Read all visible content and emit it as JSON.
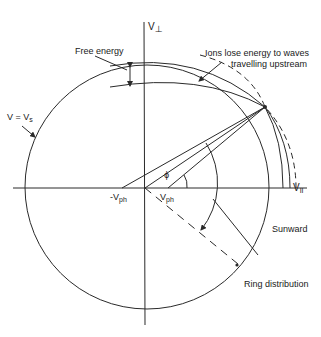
{
  "diagram": {
    "colors": {
      "line": "#2a2a2a",
      "background": "#ffffff"
    },
    "axes": {
      "v_perp": {
        "label": "V",
        "subscript": "⊥"
      },
      "v_par": {
        "label": "V",
        "subscript": "II"
      }
    },
    "labels": {
      "free_energy": "Free energy",
      "v_equals_vs": {
        "text": "V = V",
        "subscript": "s"
      },
      "ions_lose_line1": "Ions lose energy to waves",
      "ions_lose_line2": "travelling upstream",
      "neg_vph": {
        "text": "-V",
        "subscript": "ph"
      },
      "vph": {
        "text": "V",
        "subscript": "ph"
      },
      "phi": "ϕ",
      "sunward": "Sunward",
      "ring_distribution": "Ring distribution"
    }
  }
}
